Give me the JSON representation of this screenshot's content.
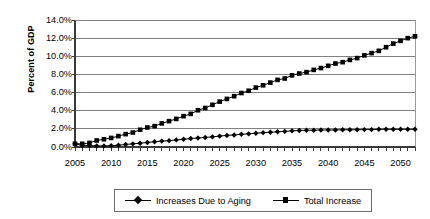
{
  "chart_data": {
    "type": "line",
    "title": "",
    "subtitle": "",
    "xlabel": "",
    "ylabel": "Percent of GDP",
    "xlim": [
      2005,
      2052
    ],
    "ylim": [
      0,
      14
    ],
    "grid": true,
    "grid_axis": "y",
    "legend_position": "bottom",
    "y_tick_labels": [
      "0.0%",
      "2.0%",
      "4.0%",
      "6.0%",
      "8.0%",
      "10.0%",
      "12.0%",
      "14.0%"
    ],
    "y_tick_values": [
      0,
      2,
      4,
      6,
      8,
      10,
      12,
      14
    ],
    "x_tick_labels": [
      "2005",
      "2010",
      "2015",
      "2020",
      "2025",
      "2030",
      "2035",
      "2040",
      "2045",
      "2050"
    ],
    "x_tick_values": [
      2005,
      2010,
      2015,
      2020,
      2025,
      2030,
      2035,
      2040,
      2045,
      2050
    ],
    "x": [
      2005,
      2006,
      2007,
      2008,
      2009,
      2010,
      2011,
      2012,
      2013,
      2014,
      2015,
      2016,
      2017,
      2018,
      2019,
      2020,
      2021,
      2022,
      2023,
      2024,
      2025,
      2026,
      2027,
      2028,
      2029,
      2030,
      2031,
      2032,
      2033,
      2034,
      2035,
      2036,
      2037,
      2038,
      2039,
      2040,
      2041,
      2042,
      2043,
      2044,
      2045,
      2046,
      2047,
      2048,
      2049,
      2050,
      2051,
      2052
    ],
    "series": [
      {
        "name": "Increases Due to Aging",
        "marker": "diamond",
        "color": "#000000",
        "values": [
          0.35,
          0.2,
          0.15,
          0.12,
          0.12,
          0.15,
          0.2,
          0.28,
          0.35,
          0.42,
          0.5,
          0.58,
          0.65,
          0.7,
          0.78,
          0.85,
          0.93,
          1.0,
          1.05,
          1.12,
          1.2,
          1.28,
          1.33,
          1.4,
          1.45,
          1.52,
          1.58,
          1.62,
          1.68,
          1.72,
          1.78,
          1.82,
          1.85,
          1.85,
          1.88,
          1.88,
          1.88,
          1.9,
          1.9,
          1.9,
          1.92,
          1.92,
          1.95,
          1.95,
          1.95,
          1.95,
          1.95,
          1.95
        ]
      },
      {
        "name": "Total Increase",
        "marker": "square",
        "color": "#000000",
        "values": [
          0.35,
          0.35,
          0.45,
          0.72,
          0.85,
          1.0,
          1.2,
          1.42,
          1.6,
          1.9,
          2.15,
          2.3,
          2.6,
          2.85,
          3.1,
          3.4,
          3.65,
          4.05,
          4.3,
          4.65,
          5.0,
          5.3,
          5.6,
          5.95,
          6.2,
          6.55,
          6.8,
          7.1,
          7.4,
          7.55,
          7.9,
          8.1,
          8.25,
          8.5,
          8.7,
          8.95,
          9.2,
          9.35,
          9.6,
          9.8,
          10.1,
          10.35,
          10.6,
          11.0,
          11.4,
          11.7,
          12.0,
          12.2
        ]
      }
    ]
  },
  "legend": {
    "items": [
      {
        "label": "Increases Due to Aging",
        "marker": "diamond"
      },
      {
        "label": "Total Increase",
        "marker": "square"
      }
    ]
  },
  "axes": {
    "y_title": "Percent of GDP"
  }
}
